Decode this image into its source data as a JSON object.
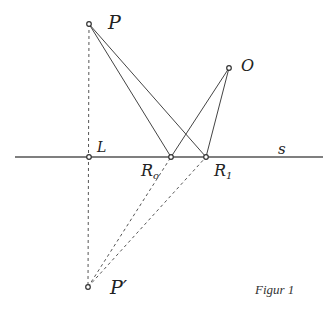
{
  "figure": {
    "caption": "Figur 1",
    "colors": {
      "stroke": "#444444",
      "text": "#222222",
      "background": "#ffffff"
    }
  },
  "points": {
    "P": {
      "label": "P",
      "x": 89,
      "y": 24
    },
    "O": {
      "label": "O",
      "x": 229,
      "y": 68
    },
    "L": {
      "label": "L",
      "x": 89,
      "y": 157
    },
    "R0": {
      "label": "R",
      "subscript": "o",
      "x": 171,
      "y": 157
    },
    "R1": {
      "label": "R",
      "subscript": "1",
      "x": 206,
      "y": 157
    },
    "Pp": {
      "label": "P′",
      "x": 88,
      "y": 287
    }
  },
  "line_s": {
    "label": "s",
    "x1": 15,
    "x2": 323,
    "y": 157
  },
  "segments_solid": [
    [
      "P",
      "R0"
    ],
    [
      "P",
      "R1"
    ],
    [
      "O",
      "R0"
    ],
    [
      "O",
      "R1"
    ]
  ],
  "segments_dashed": [
    [
      "P",
      "Pp"
    ],
    [
      "Pp",
      "R0"
    ],
    [
      "Pp",
      "R1"
    ]
  ]
}
